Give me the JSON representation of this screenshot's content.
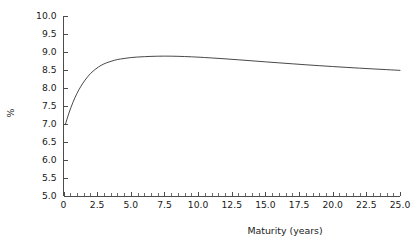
{
  "chart_data": {
    "type": "line",
    "title": "",
    "xlabel": "Maturity (years)",
    "ylabel": "%",
    "xlim": [
      0,
      25
    ],
    "ylim": [
      5.0,
      10.0
    ],
    "grid": false,
    "legend": false,
    "legend_position": "none",
    "line_color": "#333333",
    "x_ticks": [
      0,
      2.5,
      5.0,
      7.5,
      10.0,
      12.5,
      15.0,
      17.5,
      20.0,
      22.5,
      25.0
    ],
    "x_tick_labels": [
      "0",
      "2.5",
      "5.0",
      "7.5",
      "10.0",
      "12.5",
      "15.0",
      "17.5",
      "20.0",
      "22.5",
      "25.0"
    ],
    "x_minor_step": 0.5,
    "y_ticks": [
      5.0,
      5.5,
      6.0,
      6.5,
      7.0,
      7.5,
      8.0,
      8.5,
      9.0,
      9.5,
      10.0
    ],
    "y_tick_labels": [
      "5.0",
      "5.5",
      "6.0",
      "6.5",
      "7.0",
      "7.5",
      "8.0",
      "8.5",
      "9.0",
      "9.5",
      "10.0"
    ],
    "series": [
      {
        "name": "yield curve",
        "x": [
          0.15,
          0.4,
          0.7,
          1.0,
          1.3,
          1.6,
          2.0,
          2.4,
          2.8,
          3.2,
          3.6,
          4.0,
          4.5,
          5.0,
          5.5,
          6.0,
          6.5,
          7.0,
          7.5,
          8.0,
          8.5,
          9.0,
          9.5,
          10.0,
          11.0,
          12.0,
          13.0,
          14.0,
          15.0,
          16.0,
          17.0,
          18.0,
          19.0,
          20.0,
          21.0,
          22.0,
          23.0,
          24.0,
          25.0
        ],
        "y": [
          7.0,
          7.3,
          7.6,
          7.85,
          8.05,
          8.22,
          8.4,
          8.53,
          8.63,
          8.7,
          8.75,
          8.79,
          8.82,
          8.845,
          8.86,
          8.87,
          8.878,
          8.883,
          8.885,
          8.884,
          8.88,
          8.874,
          8.866,
          8.857,
          8.835,
          8.81,
          8.783,
          8.755,
          8.727,
          8.699,
          8.672,
          8.645,
          8.62,
          8.596,
          8.573,
          8.551,
          8.53,
          8.51,
          8.49
        ]
      }
    ]
  }
}
